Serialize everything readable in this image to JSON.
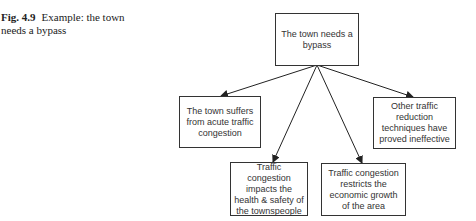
{
  "caption": {
    "label": "Fig. 4.9",
    "text": "Example: the town needs a bypass"
  },
  "diagram": {
    "root": {
      "text": "The town needs a bypass"
    },
    "children": [
      {
        "text": "The town suffers from acute traffic congestion"
      },
      {
        "text": "Traffic congestion impacts the health & safety of the townspeople"
      },
      {
        "text": "Traffic congestion restricts the economic growth of the area"
      },
      {
        "text": "Other traffic reduction techniques have proved ineffective"
      }
    ]
  }
}
